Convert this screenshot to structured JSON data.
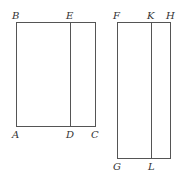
{
  "diagram": {
    "colors": {
      "line": "#555555",
      "label": "#333333",
      "background": "#ffffff"
    },
    "figures": [
      {
        "name": "rectangle-ABCD",
        "vertices": {
          "B": [
            16,
            22
          ],
          "C": [
            95,
            126
          ],
          "A": [
            16,
            126
          ],
          "top_right": [
            95,
            22
          ]
        },
        "divider": {
          "from": "E",
          "to": "D",
          "x": 70
        },
        "labels": [
          {
            "text": "B",
            "x": 12,
            "y": 19
          },
          {
            "text": "E",
            "x": 66,
            "y": 19
          },
          {
            "text": "A",
            "x": 12,
            "y": 138
          },
          {
            "text": "D",
            "x": 66,
            "y": 138
          },
          {
            "text": "C",
            "x": 91,
            "y": 138
          }
        ]
      },
      {
        "name": "rectangle-FGH",
        "vertices": {
          "F": [
            117,
            22
          ],
          "H": [
            170,
            22
          ],
          "G": [
            117,
            158
          ]
        },
        "divider": {
          "from": "K",
          "to": "L",
          "x": 151
        },
        "labels": [
          {
            "text": "F",
            "x": 113,
            "y": 19
          },
          {
            "text": "K",
            "x": 147,
            "y": 19
          },
          {
            "text": "H",
            "x": 166,
            "y": 19
          },
          {
            "text": "G",
            "x": 113,
            "y": 170
          },
          {
            "text": "L",
            "x": 148,
            "y": 170
          }
        ]
      }
    ]
  }
}
